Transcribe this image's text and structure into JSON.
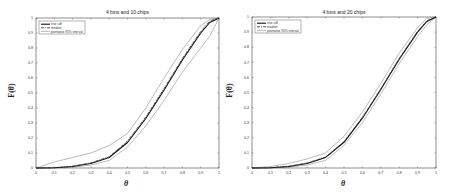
{
  "chart_data": [
    {
      "type": "line",
      "title": "4 bins and 10 chips",
      "xlabel": "θ",
      "ylabel": "F(θ)",
      "xlim": [
        0,
        1
      ],
      "ylim": [
        0,
        1
      ],
      "xticks": [
        "0",
        "0.1",
        "0.2",
        "0.3",
        "0.4",
        "0.5",
        "0.6",
        "0.7",
        "0.8",
        "0.9",
        "1"
      ],
      "yticks": [
        "0",
        "0.1",
        "0.2",
        "0.3",
        "0.4",
        "0.5",
        "0.6",
        "0.7",
        "0.8",
        "0.9",
        "1"
      ],
      "grid": false,
      "legend_position": "upper left",
      "x": [
        0,
        0.1,
        0.2,
        0.3,
        0.4,
        0.5,
        0.6,
        0.7,
        0.8,
        0.9,
        0.95,
        1
      ],
      "series": [
        {
          "name": "true cdf",
          "style": "solid-thick",
          "values": [
            0,
            0.002,
            0.01,
            0.03,
            0.07,
            0.17,
            0.33,
            0.52,
            0.72,
            0.9,
            0.97,
            1
          ]
        },
        {
          "name": "median",
          "style": "dashdot",
          "values": [
            0,
            0.002,
            0.012,
            0.035,
            0.075,
            0.18,
            0.34,
            0.53,
            0.73,
            0.91,
            0.98,
            1
          ]
        },
        {
          "name": "pointwise 95% interval (upper)",
          "style": "thin",
          "values": [
            0,
            0.04,
            0.07,
            0.1,
            0.15,
            0.23,
            0.4,
            0.6,
            0.79,
            0.95,
            0.99,
            1
          ]
        },
        {
          "name": "pointwise 95% interval (lower)",
          "style": "thin",
          "values": [
            0,
            0.0,
            0.005,
            0.02,
            0.05,
            0.14,
            0.28,
            0.45,
            0.64,
            0.8,
            0.88,
            1
          ]
        }
      ]
    },
    {
      "type": "line",
      "title": "4 bins and 20 chips",
      "xlabel": "θ",
      "ylabel": "F(θ)",
      "xlim": [
        0,
        1
      ],
      "ylim": [
        0,
        1
      ],
      "xticks": [
        "0",
        "0.1",
        "0.2",
        "0.3",
        "0.4",
        "0.5",
        "0.6",
        "0.7",
        "0.8",
        "0.9",
        "1"
      ],
      "yticks": [
        "0",
        "0.1",
        "0.2",
        "0.3",
        "0.4",
        "0.5",
        "0.6",
        "0.7",
        "0.8",
        "0.9",
        "1"
      ],
      "grid": false,
      "legend_position": "upper left",
      "x": [
        0,
        0.1,
        0.2,
        0.3,
        0.4,
        0.5,
        0.6,
        0.7,
        0.8,
        0.9,
        0.95,
        1
      ],
      "series": [
        {
          "name": "true cdf",
          "style": "solid-thick",
          "values": [
            0,
            0.002,
            0.01,
            0.03,
            0.07,
            0.17,
            0.33,
            0.52,
            0.72,
            0.9,
            0.97,
            1
          ]
        },
        {
          "name": "median",
          "style": "dashdot",
          "values": [
            0,
            0.002,
            0.012,
            0.033,
            0.072,
            0.175,
            0.335,
            0.525,
            0.725,
            0.905,
            0.975,
            1
          ]
        },
        {
          "name": "pointwise 95% interval (upper)",
          "style": "thin",
          "values": [
            0,
            0.01,
            0.03,
            0.06,
            0.1,
            0.21,
            0.37,
            0.56,
            0.76,
            0.93,
            0.99,
            1
          ]
        },
        {
          "name": "pointwise 95% interval (lower)",
          "style": "thin",
          "values": [
            0,
            0.0,
            0.005,
            0.02,
            0.05,
            0.15,
            0.3,
            0.49,
            0.69,
            0.87,
            0.95,
            1
          ]
        }
      ]
    }
  ],
  "legend_labels": {
    "true_cdf": "true cdf",
    "median": "median",
    "interval": "pointwise 95% interval"
  },
  "charts": [
    {
      "title": "4 bins and 10 chips",
      "xlabel": "θ",
      "ylabel": "F(θ)"
    },
    {
      "title": "4 bins and 20 chips",
      "xlabel": "θ",
      "ylabel": "F(θ)"
    }
  ]
}
